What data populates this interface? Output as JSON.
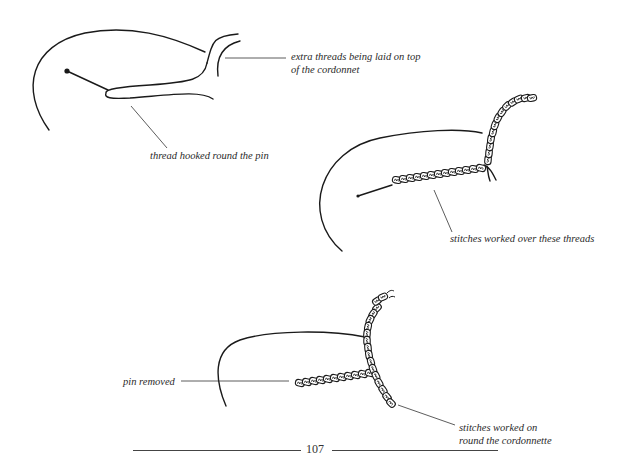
{
  "figures": [
    {
      "id": "fig-1",
      "labels": [
        {
          "text_lines": [
            "extra threads being laid on top",
            "of the cordonnet"
          ]
        },
        {
          "text_lines": [
            "thread hooked round the pin"
          ]
        }
      ]
    },
    {
      "id": "fig-2",
      "labels": [
        {
          "text_lines": [
            "stitches worked over these threads"
          ]
        }
      ]
    },
    {
      "id": "fig-3",
      "labels": [
        {
          "text_lines": [
            "pin removed"
          ]
        },
        {
          "text_lines": [
            "stitches worked on",
            "round the cordonnette"
          ]
        }
      ]
    }
  ],
  "footer": {
    "page_number": "107"
  },
  "colors": {
    "ink": "#1a1a1a",
    "caption": "#2a2a2a",
    "paper": "#ffffff"
  }
}
